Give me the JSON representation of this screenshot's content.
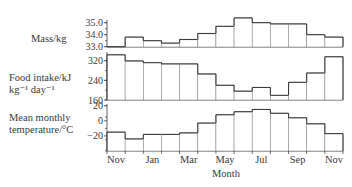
{
  "chart_data": [
    {
      "type": "bar",
      "panel": "mass",
      "title": "",
      "ylabel": "Mass/kg",
      "xlabel": "Month",
      "categories": [
        "Nov",
        "Dec",
        "Jan",
        "Feb",
        "Mar",
        "Apr",
        "May",
        "Jun",
        "Jul",
        "Aug",
        "Sep",
        "Oct",
        "Nov"
      ],
      "values": [
        33.0,
        33.8,
        33.5,
        33.3,
        33.6,
        34.1,
        34.7,
        35.4,
        35.0,
        34.9,
        34.9,
        34.0,
        33.8
      ],
      "ylim": [
        33.0,
        35.0
      ],
      "yticks": [
        "35.0",
        "34.0",
        "33.0"
      ],
      "style": "step histogram"
    },
    {
      "type": "bar",
      "panel": "food_intake",
      "title": "",
      "ylabel": "Food intake/kJ kg⁻¹ day⁻¹",
      "xlabel": "Month",
      "categories": [
        "Nov",
        "Dec",
        "Jan",
        "Feb",
        "Mar",
        "Apr",
        "May",
        "Jun",
        "Jul",
        "Aug",
        "Sep",
        "Oct",
        "Nov"
      ],
      "values": [
        344,
        319,
        312,
        307,
        307,
        266,
        220,
        196,
        211,
        179,
        232,
        270,
        336
      ],
      "ylim": [
        160,
        350
      ],
      "yticks": [
        "320",
        "240",
        "160"
      ],
      "style": "step histogram"
    },
    {
      "type": "bar",
      "panel": "temperature",
      "title": "",
      "ylabel": "Mean monthly temperature/°C",
      "xlabel": "Month",
      "categories": [
        "Nov",
        "Dec",
        "Jan",
        "Feb",
        "Mar",
        "Apr",
        "May",
        "Jun",
        "Jul",
        "Aug",
        "Sep",
        "Oct",
        "Nov"
      ],
      "values": [
        -15,
        -24,
        -18,
        -18,
        -16,
        -3,
        8,
        12,
        15,
        10,
        4,
        -4,
        -17
      ],
      "ylim": [
        -40,
        20
      ],
      "yticks": [
        "20",
        "0",
        "-20"
      ],
      "style": "step histogram"
    }
  ],
  "labels": {
    "mass_label": "Mass/kg",
    "food_label_line1": "Food intake/kJ",
    "food_label_line2": "kg⁻¹ day⁻¹",
    "temp_label_line1": "Mean monthly",
    "temp_label_line2": "temperature/°C",
    "x_axis_title": "Month",
    "x_tick_labels": [
      "Nov",
      "Jan",
      "Mar",
      "May",
      "Jul",
      "Sep",
      "Nov"
    ]
  },
  "colors": {
    "line": "#3a3a3a",
    "text": "#3a3a3a",
    "background": "#ffffff"
  }
}
